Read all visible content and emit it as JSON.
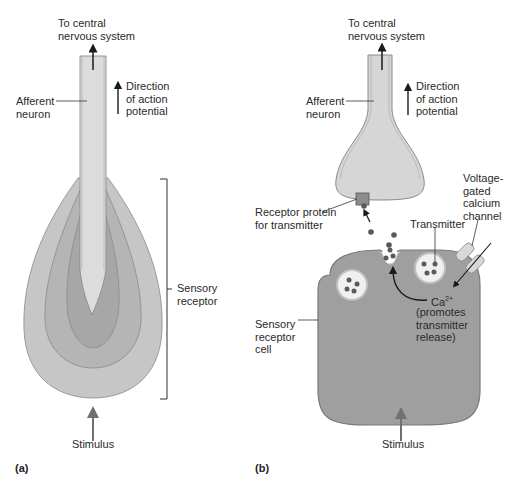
{
  "figure": {
    "panels": [
      {
        "id": "a",
        "tag": "(a)",
        "labels": {
          "to_cns": "To central\nnervous system",
          "afferent": "Afferent\nneuron",
          "direction": "Direction\nof action\npotential",
          "sensory_receptor": "Sensory\nreceptor",
          "stimulus": "Stimulus"
        }
      },
      {
        "id": "b",
        "tag": "(b)",
        "labels": {
          "to_cns": "To central\nnervous system",
          "afferent": "Afferent\nneuron",
          "direction": "Direction\nof action\npotential",
          "receptor_protein": "Receptor protein\nfor transmitter",
          "transmitter": "Transmitter",
          "voltage_channel": "Voltage-\ngated\ncalcium\nchannel",
          "ca_ion": "Ca",
          "ca_charge": "2+",
          "ca_note": "(promotes\ntransmitter\nrelease)",
          "sensory_cell": "Sensory\nreceptor\ncell",
          "stimulus": "Stimulus"
        }
      }
    ],
    "colors": {
      "neuron_fill": "#d9d9d9",
      "outer_layer": "#c4c4c4",
      "mid_layer": "#b3b3b3",
      "inner_layer": "#a6a6a6",
      "cell_fill": "#9e9e9e",
      "dot": "#5a5a5a",
      "arrow": "#1a1a1a",
      "stimulus_arrow": "#707070"
    }
  }
}
